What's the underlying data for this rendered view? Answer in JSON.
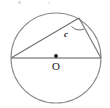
{
  "figure": {
    "canvas": {
      "width": 110,
      "height": 108,
      "background": "#ffffff"
    },
    "stroke": {
      "circle_color": "#8c8c8c",
      "chord_color": "#6e6e6e",
      "diameter_color": "#5a5a5a",
      "arc_color": "#6e6e6e"
    },
    "circle": {
      "cx": 56,
      "cy": 58,
      "r": 45
    },
    "center_point": {
      "cx": 56,
      "cy": 56,
      "r": 1.9,
      "color": "#1a1a1a"
    },
    "diameter": {
      "x1": 11,
      "y1": 58,
      "x2": 101,
      "y2": 58
    },
    "triangle": {
      "vertex_left": {
        "x": 11,
        "y": 58
      },
      "vertex_right": {
        "x": 101,
        "y": 58
      },
      "vertex_apex": {
        "x": 79,
        "y": 18
      }
    },
    "angle_arc": {
      "d": "M 71.5 26.5 A 12 12 0 0 0 84.2 29.0",
      "at_vertex": "apex"
    },
    "labels": {
      "angle_c": "c",
      "center_O": "O"
    },
    "specks": [
      {
        "left": 18,
        "top": 1,
        "size": 3,
        "color": "#d9d9d9"
      },
      {
        "left": 48,
        "top": 2,
        "size": 2,
        "color": "#e2e2e2"
      }
    ]
  }
}
